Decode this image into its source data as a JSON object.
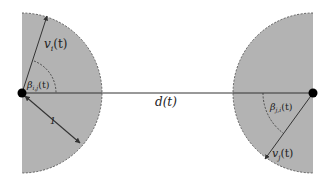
{
  "diagram": {
    "fill_color": "#b3b3b3",
    "stroke_color": "#333333",
    "left_agent": {
      "name": "agent-i",
      "center": [
        22,
        93
      ],
      "radius": 80,
      "velocity_label": "v",
      "velocity_sub": "i",
      "velocity_arg": "(t)",
      "angle_label": "β",
      "angle_sub": "i,j",
      "angle_arg": "(t)",
      "radius_label": "1"
    },
    "right_agent": {
      "name": "agent-j",
      "center": [
        313,
        93
      ],
      "radius": 80,
      "velocity_label": "v",
      "velocity_sub": "j",
      "velocity_arg": "(t)",
      "angle_label": "β",
      "angle_sub": "j,i",
      "angle_arg": "(t)"
    },
    "distance_label": "d(t)"
  }
}
